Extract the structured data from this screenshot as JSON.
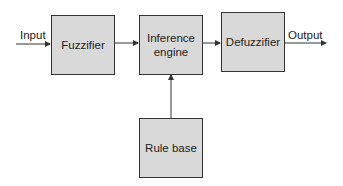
{
  "diagram": {
    "blocks": {
      "fuzzifier": "Fuzzifier",
      "inference_engine_line1": "Inference",
      "inference_engine_line2": "engine",
      "defuzzifier": "Defuzzifier",
      "rule_base": "Rule base"
    },
    "labels": {
      "input": "Input",
      "output": "Output"
    },
    "colors": {
      "box_fill": "#d9d9d9",
      "stroke": "#333333"
    }
  }
}
